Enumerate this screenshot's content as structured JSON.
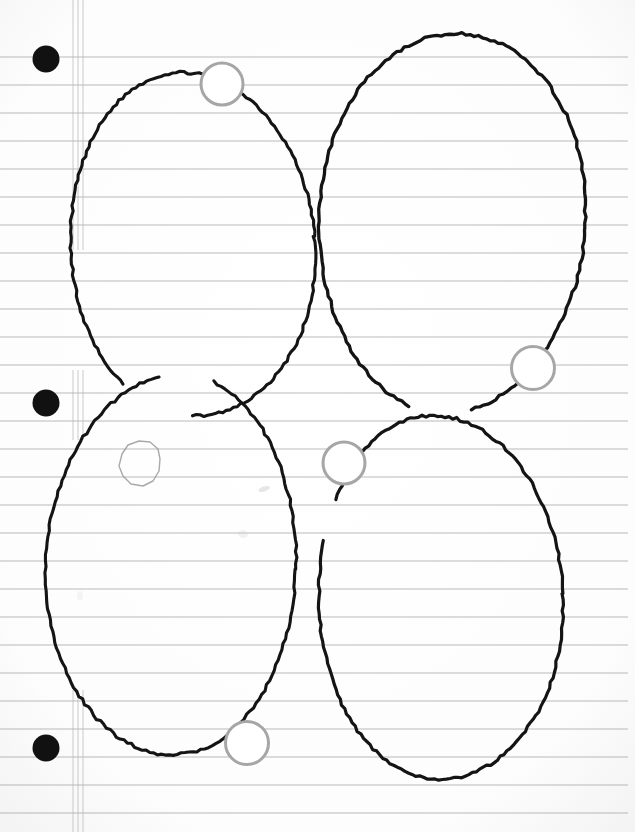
{
  "document": {
    "kind": "scanned-notebook-page",
    "title": "Hand-drawn ellipses on ruled loose-leaf paper",
    "width": 635,
    "height": 832,
    "background_color": "#ffffff",
    "paper_tint": "#fdfdfd",
    "vignette_edge_color": "#f2f2f2"
  },
  "paper": {
    "rule_line_color": "#8f8f8f",
    "rule_line_width": 1.1,
    "rule_spacing": 28,
    "rule_first_y": 57,
    "rule_count": 28,
    "rule_x_start": 0,
    "rule_x_end": 628,
    "margin_lines": {
      "color": "#b4b4b4",
      "width": 1,
      "x_positions": [
        73,
        78,
        83
      ],
      "segments": [
        {
          "y_start": 0,
          "y_end": 250
        },
        {
          "y_start": 370,
          "y_end": 440
        },
        {
          "y_start": 690,
          "y_end": 832
        }
      ]
    },
    "binder_holes": {
      "fill": "#111111",
      "radius": 13.5,
      "cx": 46,
      "cy_positions": [
        59,
        403,
        748
      ]
    }
  },
  "ink": {
    "ellipse_stroke": "#141414",
    "marker_stroke": "#a6a6a6",
    "pencil_stroke": "#9a9a9a",
    "smudge_color": "#c9c9c9"
  },
  "shapes": {
    "ellipses": [
      {
        "id": "ellipse-top-left",
        "label": "Top-left ellipse",
        "cx": 192,
        "cy": 245,
        "rx": 122,
        "ry": 172,
        "rotation": -4,
        "gap_start_deg": 96,
        "gap_end_deg": 128,
        "stroke_width": 3.1
      },
      {
        "id": "ellipse-top-right",
        "label": "Top-right ellipse",
        "cx": 452,
        "cy": 222,
        "rx": 133,
        "ry": 190,
        "rotation": 3,
        "gap_start_deg": 78,
        "gap_end_deg": 104,
        "stroke_width": 3.3
      },
      {
        "id": "ellipse-bottom-left",
        "label": "Bottom-left ellipse",
        "cx": 172,
        "cy": 565,
        "rx": 125,
        "ry": 190,
        "rotation": 2,
        "gap_start_deg": 262,
        "gap_end_deg": 286,
        "stroke_width": 3.1
      },
      {
        "id": "ellipse-bottom-right",
        "label": "Bottom-right ellipse",
        "cx": 440,
        "cy": 598,
        "rx": 122,
        "ry": 182,
        "rotation": -2,
        "gap_start_deg": 200,
        "gap_end_deg": 214,
        "stroke_width": 3.2
      }
    ],
    "markers": [
      {
        "id": "marker-1",
        "label": "Marker on top-left ellipse",
        "cx": 222,
        "cy": 84,
        "r": 21,
        "stroke_width": 3
      },
      {
        "id": "marker-2",
        "label": "Marker on top-right ellipse",
        "cx": 533,
        "cy": 368,
        "r": 21.5,
        "stroke_width": 3
      },
      {
        "id": "marker-3",
        "label": "Marker between bottom ellipses",
        "cx": 344,
        "cy": 463,
        "r": 21,
        "stroke_width": 3
      },
      {
        "id": "marker-4",
        "label": "Marker on bottom-left ellipse",
        "cx": 247,
        "cy": 743,
        "r": 21.5,
        "stroke_width": 3
      }
    ],
    "pencil_blob": {
      "id": "pencil-blob",
      "label": "Small hand-drawn blob inside bottom-left ellipse",
      "cx": 138,
      "cy": 465,
      "points": "122,454 128,445 139,441 150,442 158,449 160,459 159,471 153,481 143,486 131,484 123,476 119,466",
      "stroke_width": 1.4
    },
    "smudges": [
      {
        "id": "smudge-1",
        "cx": 264,
        "cy": 489,
        "rx": 6,
        "ry": 2.5,
        "rotation": -18,
        "opacity": 0.45
      },
      {
        "id": "smudge-2",
        "cx": 243,
        "cy": 534,
        "rx": 5,
        "ry": 4,
        "rotation": 12,
        "opacity": 0.22
      },
      {
        "id": "smudge-3",
        "cx": 80,
        "cy": 596,
        "rx": 3,
        "ry": 5,
        "rotation": 0,
        "opacity": 0.16
      }
    ]
  }
}
